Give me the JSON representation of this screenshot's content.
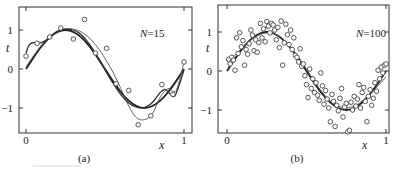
{
  "chart_data": [
    {
      "type": "scatter",
      "panel_label": "(a)",
      "annotation": "N=15",
      "xlabel": "x",
      "ylabel": "t",
      "xlim": [
        -0.015,
        1.02
      ],
      "ylim": [
        -1.6,
        1.6
      ],
      "xticks": [
        0,
        1
      ],
      "xtick_labels": [
        "0",
        "1"
      ],
      "yticks": [
        -1,
        0,
        1
      ],
      "ytick_labels": [
        "−1",
        "0",
        "1"
      ],
      "grid": false,
      "points": {
        "x": [
          0.0,
          0.07,
          0.15,
          0.22,
          0.3,
          0.37,
          0.44,
          0.51,
          0.57,
          0.65,
          0.71,
          0.79,
          0.86,
          0.93,
          1.0
        ],
        "t": [
          0.33,
          0.66,
          0.82,
          1.05,
          0.77,
          1.27,
          0.41,
          0.53,
          -0.38,
          -0.55,
          -1.43,
          -1.2,
          -0.4,
          -0.65,
          0.18
        ]
      },
      "series": [
        {
          "name": "true-function-sin",
          "style": "thick",
          "x": [
            0,
            0.05,
            0.1,
            0.15,
            0.2,
            0.25,
            0.3,
            0.35,
            0.4,
            0.45,
            0.5,
            0.55,
            0.6,
            0.65,
            0.7,
            0.75,
            0.8,
            0.85,
            0.9,
            0.95,
            1.0
          ],
          "t": [
            0,
            0.31,
            0.59,
            0.81,
            0.95,
            1.0,
            0.95,
            0.81,
            0.59,
            0.31,
            0,
            -0.31,
            -0.59,
            -0.81,
            -0.95,
            -1.0,
            -0.95,
            -0.81,
            -0.59,
            -0.31,
            0
          ]
        },
        {
          "name": "gp-mean-fit",
          "style": "thin",
          "x": [
            0,
            0.05,
            0.1,
            0.15,
            0.2,
            0.25,
            0.3,
            0.35,
            0.4,
            0.45,
            0.5,
            0.55,
            0.6,
            0.65,
            0.7,
            0.75,
            0.8,
            0.85,
            0.9,
            0.95,
            1.0
          ],
          "t": [
            0.05,
            0.35,
            0.62,
            0.83,
            0.96,
            1.03,
            1.02,
            0.95,
            0.8,
            0.57,
            0.27,
            -0.08,
            -0.5,
            -0.95,
            -1.25,
            -1.3,
            -1.15,
            -0.72,
            -0.5,
            -0.55,
            0.18
          ]
        },
        {
          "name": "overfit-poly",
          "style": "medium",
          "x": [
            0,
            0.02,
            0.05,
            0.08,
            0.12,
            0.16,
            0.2,
            0.25,
            0.3,
            0.35,
            0.4,
            0.45,
            0.5,
            0.55,
            0.6,
            0.65,
            0.7,
            0.75,
            0.8,
            0.85,
            0.88,
            0.91,
            0.94,
            0.97,
            1.0
          ],
          "t": [
            0.4,
            0.62,
            0.68,
            0.66,
            0.72,
            0.85,
            0.97,
            1.02,
            1.0,
            0.88,
            0.64,
            0.33,
            -0.02,
            -0.36,
            -0.66,
            -0.87,
            -0.98,
            -0.99,
            -0.86,
            -0.6,
            -0.52,
            -0.63,
            -0.7,
            -0.4,
            -0.02
          ]
        }
      ]
    },
    {
      "type": "scatter",
      "panel_label": "(b)",
      "annotation": "N=100",
      "xlabel": "x",
      "ylabel": "t",
      "xlim": [
        -0.015,
        1.02
      ],
      "ylim": [
        -1.6,
        1.6
      ],
      "xticks": [
        0,
        1
      ],
      "xtick_labels": [
        "0",
        "1"
      ],
      "yticks": [
        -1,
        0,
        1
      ],
      "ytick_labels": [
        "−1",
        "0",
        "1"
      ],
      "grid": false,
      "points": {
        "x": [
          0.01,
          0.02,
          0.03,
          0.04,
          0.05,
          0.06,
          0.07,
          0.08,
          0.09,
          0.1,
          0.11,
          0.12,
          0.13,
          0.14,
          0.15,
          0.16,
          0.17,
          0.18,
          0.19,
          0.2,
          0.21,
          0.22,
          0.23,
          0.24,
          0.25,
          0.26,
          0.27,
          0.28,
          0.29,
          0.3,
          0.31,
          0.32,
          0.33,
          0.34,
          0.35,
          0.36,
          0.37,
          0.38,
          0.39,
          0.4,
          0.41,
          0.42,
          0.43,
          0.44,
          0.45,
          0.46,
          0.47,
          0.48,
          0.49,
          0.5,
          0.51,
          0.52,
          0.53,
          0.54,
          0.55,
          0.56,
          0.57,
          0.58,
          0.59,
          0.6,
          0.61,
          0.62,
          0.63,
          0.64,
          0.65,
          0.66,
          0.67,
          0.68,
          0.69,
          0.7,
          0.71,
          0.72,
          0.73,
          0.74,
          0.75,
          0.76,
          0.77,
          0.78,
          0.79,
          0.8,
          0.81,
          0.82,
          0.83,
          0.84,
          0.85,
          0.86,
          0.87,
          0.88,
          0.89,
          0.9,
          0.91,
          0.92,
          0.93,
          0.94,
          0.95,
          0.96,
          0.97,
          0.98,
          0.99,
          1.0
        ],
        "t": [
          0.3,
          0.18,
          0.35,
          0.28,
          0.02,
          0.85,
          0.45,
          0.98,
          0.62,
          0.78,
          0.15,
          0.55,
          0.43,
          0.7,
          1.05,
          0.92,
          0.52,
          0.8,
          0.48,
          0.73,
          1.22,
          0.85,
          1.08,
          0.75,
          1.27,
          1.15,
          0.98,
          1.22,
          1.18,
          1.05,
          0.8,
          1.12,
          0.6,
          1.28,
          0.15,
          0.72,
          1.2,
          0.93,
          0.68,
          1.05,
          0.55,
          0.85,
          0.4,
          0.35,
          0.23,
          0.57,
          0.12,
          0.18,
          -0.12,
          -0.35,
          -0.68,
          0.05,
          -0.45,
          -0.2,
          -0.55,
          -0.3,
          -0.62,
          -0.75,
          -0.05,
          -0.38,
          -0.85,
          -0.5,
          -0.72,
          -0.95,
          -1.3,
          -0.6,
          -0.78,
          -1.42,
          -0.88,
          -1.02,
          -0.7,
          -0.45,
          -1.18,
          -0.92,
          -0.83,
          -1.56,
          -1.52,
          -0.8,
          -1.0,
          -0.65,
          -0.9,
          -0.72,
          -0.35,
          -0.95,
          -0.55,
          -0.42,
          -0.78,
          -1.3,
          -0.65,
          -0.48,
          -0.88,
          -0.7,
          -0.3,
          -0.52,
          0.02,
          -0.2,
          0.1,
          -0.05,
          0.15,
          0.18
        ]
      },
      "series": [
        {
          "name": "true-function-sin",
          "style": "thick",
          "x": [
            0,
            0.05,
            0.1,
            0.15,
            0.2,
            0.25,
            0.3,
            0.35,
            0.4,
            0.45,
            0.5,
            0.55,
            0.6,
            0.65,
            0.7,
            0.75,
            0.8,
            0.85,
            0.9,
            0.95,
            1.0
          ],
          "t": [
            0,
            0.31,
            0.59,
            0.81,
            0.95,
            1.0,
            0.95,
            0.81,
            0.59,
            0.31,
            0,
            -0.31,
            -0.59,
            -0.81,
            -0.95,
            -1.0,
            -0.95,
            -0.81,
            -0.59,
            -0.31,
            0
          ]
        },
        {
          "name": "fit",
          "style": "thin",
          "x": [
            0,
            0.05,
            0.1,
            0.15,
            0.2,
            0.25,
            0.3,
            0.35,
            0.4,
            0.45,
            0.5,
            0.55,
            0.6,
            0.65,
            0.7,
            0.75,
            0.8,
            0.85,
            0.9,
            0.95,
            1.0
          ],
          "t": [
            0.25,
            0.4,
            0.62,
            0.8,
            0.92,
            0.98,
            0.95,
            0.83,
            0.62,
            0.35,
            0.05,
            -0.27,
            -0.55,
            -0.77,
            -0.9,
            -0.94,
            -0.9,
            -0.77,
            -0.58,
            -0.38,
            -0.15
          ]
        }
      ]
    }
  ],
  "layout": {
    "panels": [
      {
        "x0_px": 26,
        "x1_px": 184,
        "t1_px": 30,
        "t0_px": 69,
        "frame": [
          19,
          7,
          192,
          133
        ],
        "ytick_label_x": 13,
        "xtick_label_y": 144,
        "xlabel_pos": [
          159,
          149
        ],
        "ylabel_pos": [
          6,
          52
        ],
        "annotation_pos": [
          140,
          37
        ],
        "caption_pos": [
          84,
          162
        ]
      },
      {
        "x0_px": 227,
        "x1_px": 386,
        "t1_px": 32,
        "t0_px": 71,
        "frame": [
          218,
          5,
          389,
          133
        ],
        "ytick_label_x": 212,
        "xtick_label_y": 144,
        "xlabel_pos": [
          362,
          149
        ],
        "ylabel_pos": [
          206,
          52
        ],
        "annotation_pos": [
          356,
          37
        ],
        "caption_pos": [
          297,
          162
        ]
      }
    ]
  }
}
